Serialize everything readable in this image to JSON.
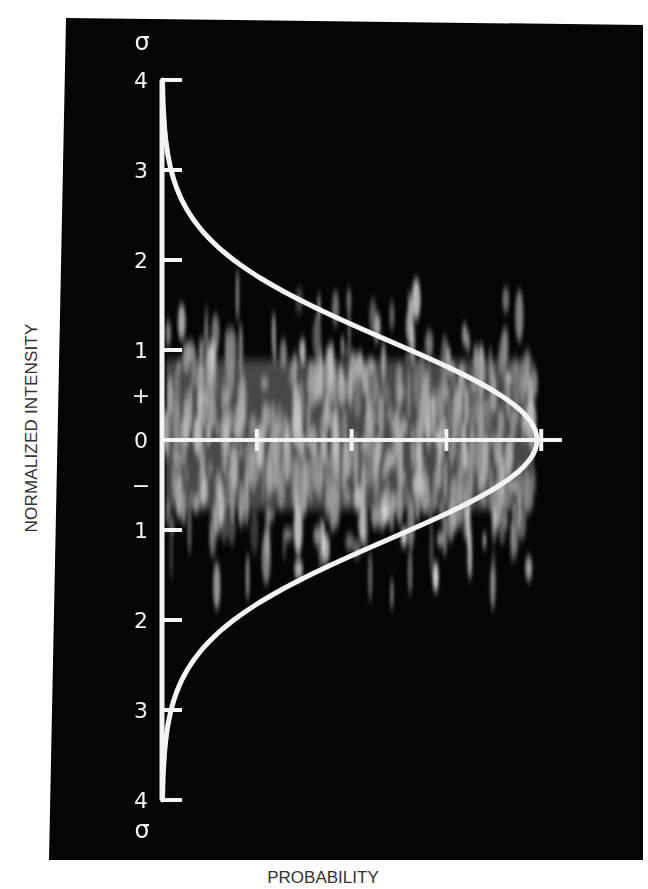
{
  "chart_data": {
    "type": "line",
    "title": "",
    "xlabel": "PROBABILITY",
    "ylabel": "NORMALIZED INTENSITY",
    "y_unit_symbol": "σ",
    "y_ticks": [
      {
        "value": 4,
        "label": "4"
      },
      {
        "value": 3,
        "label": "3"
      },
      {
        "value": 2,
        "label": "2"
      },
      {
        "value": 1,
        "label": "1"
      },
      {
        "value": 0,
        "label": "0"
      },
      {
        "value": -1,
        "label": "1"
      },
      {
        "value": -2,
        "label": "2"
      },
      {
        "value": -3,
        "label": "3"
      },
      {
        "value": -4,
        "label": "4"
      }
    ],
    "sign_markers": {
      "plus": "+",
      "minus": "−"
    },
    "x_ticks_count": 4,
    "ylim": [
      -4,
      4
    ],
    "grid": false,
    "series": [
      {
        "name": "Gaussian probability density",
        "y_sigma": [
          -4,
          -3.5,
          -3,
          -2.5,
          -2,
          -1.5,
          -1,
          -0.5,
          0,
          0.5,
          1,
          1.5,
          2,
          2.5,
          3,
          3.5,
          4
        ],
        "probability_relative": [
          0.0003,
          0.0022,
          0.011,
          0.044,
          0.135,
          0.325,
          0.607,
          0.882,
          1.0,
          0.882,
          0.607,
          0.325,
          0.135,
          0.044,
          0.011,
          0.0022,
          0.0003
        ]
      }
    ],
    "background": "speckle intensity image concentrated between about -1.5σ and +1.5σ",
    "colors": {
      "panel": "#050505",
      "curve": "#f4f4f4",
      "axis": "#f4f4f4",
      "page": "#ffffff"
    }
  }
}
